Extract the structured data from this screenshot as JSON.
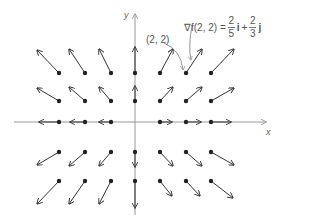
{
  "diagram": {
    "axes": {
      "x_label": "x",
      "y_label": "y"
    },
    "point_label": "(2, 2)",
    "gradient_label": {
      "lhs": "∇f(2, 2) =",
      "term1": {
        "num": "2",
        "den": "5",
        "unit": "i"
      },
      "plus": "+",
      "term2": {
        "num": "2",
        "den": "3",
        "unit": "j"
      }
    },
    "colors": {
      "arrow": "#333333",
      "axis": "#999999",
      "dot": "#222222",
      "text": "#555555"
    },
    "grid": {
      "columns_x": [
        59,
        85,
        111,
        135,
        160,
        186,
        211
      ],
      "rows_y": [
        73,
        101,
        122,
        152,
        181
      ],
      "origin": [
        135,
        122
      ]
    },
    "vectors": [
      {
        "from": [
          59,
          73
        ],
        "to": [
          37,
          50
        ]
      },
      {
        "from": [
          85,
          73
        ],
        "to": [
          69,
          49
        ]
      },
      {
        "from": [
          111,
          73
        ],
        "to": [
          99,
          49
        ]
      },
      {
        "from": [
          135,
          73
        ],
        "to": [
          135,
          47
        ]
      },
      {
        "from": [
          160,
          73
        ],
        "to": [
          173,
          49
        ]
      },
      {
        "from": [
          186,
          73
        ],
        "to": [
          202,
          49
        ]
      },
      {
        "from": [
          211,
          73
        ],
        "to": [
          234,
          49
        ]
      },
      {
        "from": [
          59,
          101
        ],
        "to": [
          37,
          88
        ]
      },
      {
        "from": [
          85,
          101
        ],
        "to": [
          69,
          87
        ]
      },
      {
        "from": [
          111,
          101
        ],
        "to": [
          99,
          87
        ]
      },
      {
        "from": [
          135,
          101
        ],
        "to": [
          135,
          86
        ]
      },
      {
        "from": [
          160,
          101
        ],
        "to": [
          173,
          87
        ]
      },
      {
        "from": [
          186,
          101
        ],
        "to": [
          202,
          87
        ]
      },
      {
        "from": [
          211,
          101
        ],
        "to": [
          234,
          88
        ]
      },
      {
        "from": [
          59,
          122
        ],
        "to": [
          39,
          122
        ]
      },
      {
        "from": [
          85,
          122
        ],
        "to": [
          70,
          122
        ]
      },
      {
        "from": [
          111,
          122
        ],
        "to": [
          99,
          122
        ]
      },
      {
        "from": [
          160,
          122
        ],
        "to": [
          172,
          122
        ]
      },
      {
        "from": [
          186,
          122
        ],
        "to": [
          201,
          122
        ]
      },
      {
        "from": [
          211,
          122
        ],
        "to": [
          231,
          122
        ]
      },
      {
        "from": [
          59,
          152
        ],
        "to": [
          37,
          165
        ]
      },
      {
        "from": [
          85,
          152
        ],
        "to": [
          69,
          166
        ]
      },
      {
        "from": [
          111,
          152
        ],
        "to": [
          99,
          166
        ]
      },
      {
        "from": [
          135,
          152
        ],
        "to": [
          135,
          167
        ]
      },
      {
        "from": [
          160,
          152
        ],
        "to": [
          173,
          166
        ]
      },
      {
        "from": [
          186,
          152
        ],
        "to": [
          202,
          166
        ]
      },
      {
        "from": [
          211,
          152
        ],
        "to": [
          234,
          165
        ]
      },
      {
        "from": [
          59,
          181
        ],
        "to": [
          37,
          204
        ]
      },
      {
        "from": [
          85,
          181
        ],
        "to": [
          69,
          204
        ]
      },
      {
        "from": [
          111,
          181
        ],
        "to": [
          99,
          204
        ]
      },
      {
        "from": [
          135,
          181
        ],
        "to": [
          135,
          208
        ]
      },
      {
        "from": [
          160,
          181
        ],
        "to": [
          172,
          196
        ]
      },
      {
        "from": [
          186,
          181
        ],
        "to": [
          200,
          196
        ]
      },
      {
        "from": [
          211,
          181
        ],
        "to": [
          233,
          198
        ]
      }
    ]
  }
}
